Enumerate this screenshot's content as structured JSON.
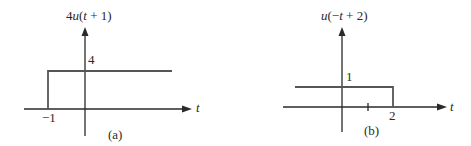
{
  "panels": [
    {
      "id": "a",
      "title": "4u(t + 1)",
      "title_parts": {
        "coef": "4",
        "fn": "u",
        "open": "(",
        "var": "t",
        "rest": " + 1)"
      },
      "y_tick_label": "4",
      "x_tick_label": "−1",
      "x_axis_label": "t",
      "caption": "(a)"
    },
    {
      "id": "b",
      "title": "u(−t + 2)",
      "title_parts": {
        "fn": "u",
        "open": "(−",
        "var": "t",
        "rest": " + 2)"
      },
      "y_tick_label": "1",
      "x_tick_label_1": "1",
      "x_tick_label_2": "2",
      "x_axis_label": "t",
      "caption": "(b)"
    }
  ],
  "colors": {
    "axis": "#2a2a2a",
    "signal": "#555555",
    "background": "#ffffff"
  }
}
